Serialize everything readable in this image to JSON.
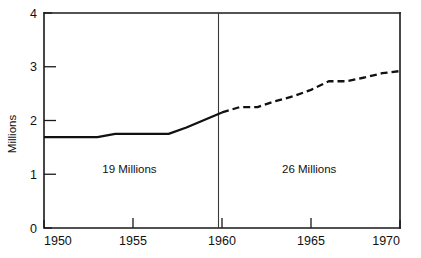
{
  "chart_data": {
    "type": "line",
    "title": "",
    "xlabel": "",
    "ylabel": "Millions",
    "xlim": [
      1950,
      1970
    ],
    "ylim": [
      0,
      4
    ],
    "grid": false,
    "legend": "none",
    "xticks": [
      1950,
      1955,
      1960,
      1965,
      1970
    ],
    "xtick_labels": [
      "1950",
      "1955",
      "1960",
      "1965",
      "1970"
    ],
    "yticks": [
      0,
      1,
      2,
      3,
      4
    ],
    "ytick_labels": [
      "0",
      "1",
      "2",
      "3",
      "4"
    ],
    "x": [
      1950,
      1951,
      1952,
      1953,
      1954,
      1955,
      1956,
      1957,
      1958,
      1959,
      1960,
      1961,
      1962,
      1963,
      1964,
      1965,
      1966,
      1967,
      1968,
      1969,
      1970
    ],
    "series": [
      {
        "name": "Actual",
        "style": "solid",
        "x": [
          1950,
          1951,
          1952,
          1953,
          1954,
          1955,
          1956,
          1957,
          1958,
          1959,
          1960
        ],
        "values": [
          1.69,
          1.69,
          1.69,
          1.69,
          1.75,
          1.75,
          1.75,
          1.75,
          1.87,
          2.01,
          2.15
        ]
      },
      {
        "name": "Projected",
        "style": "dashed",
        "x": [
          1960,
          1961,
          1962,
          1963,
          1964,
          1965,
          1966,
          1967,
          1968,
          1969,
          1970
        ],
        "values": [
          2.15,
          2.25,
          2.25,
          2.36,
          2.45,
          2.57,
          2.73,
          2.73,
          2.8,
          2.88,
          2.92
        ]
      }
    ],
    "annotations": [
      {
        "text": "19 Millions",
        "x": 1954.8,
        "y": 1.1
      },
      {
        "text": "26 Millions",
        "x": 1964.9,
        "y": 1.1
      }
    ],
    "reference_lines": [
      {
        "orientation": "vertical",
        "x": 1960
      }
    ]
  }
}
